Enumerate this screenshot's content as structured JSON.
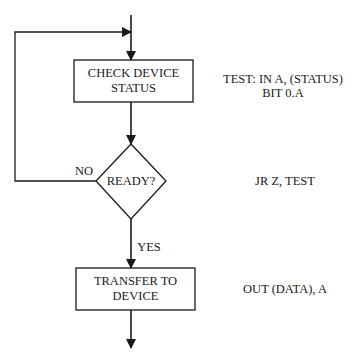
{
  "flowchart": {
    "nodes": [
      {
        "id": "check",
        "type": "process",
        "lines": [
          "CHECK DEVICE",
          "STATUS"
        ]
      },
      {
        "id": "ready",
        "type": "decision",
        "label": "READY?"
      },
      {
        "id": "transfer",
        "type": "process",
        "lines": [
          "TRANSFER TO",
          "DEVICE"
        ]
      }
    ],
    "edges": {
      "no_label": "NO",
      "yes_label": "YES"
    },
    "code": {
      "check": [
        "TEST: IN A, (STATUS)",
        "BIT 0.A"
      ],
      "ready": "JR Z, TEST",
      "transfer": "OUT (DATA), A"
    },
    "colors": {
      "line": "#1a1a1a",
      "background": "#ffffff"
    }
  }
}
